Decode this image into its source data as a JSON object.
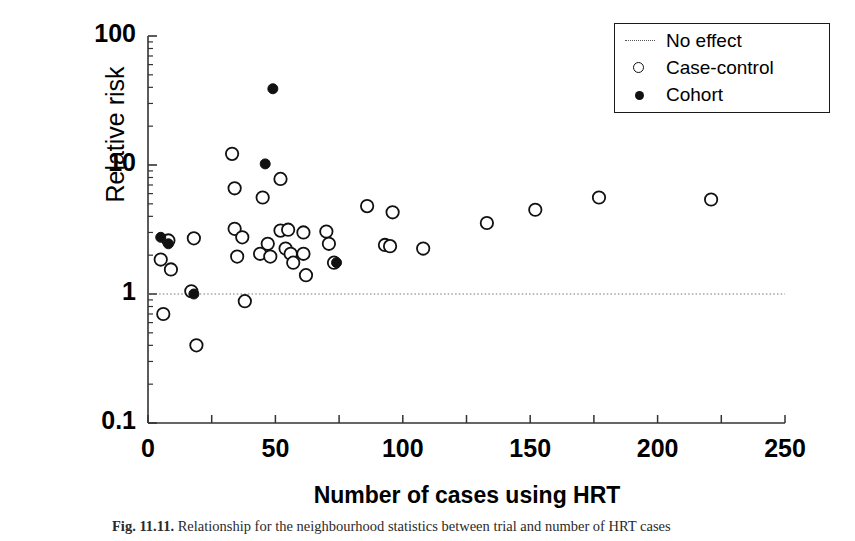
{
  "chart_data": {
    "type": "scatter",
    "title": "",
    "xlabel": "Number of cases using HRT",
    "ylabel": "Relative risk",
    "xlim": [
      0,
      250
    ],
    "ylim": [
      0.1,
      100
    ],
    "yscale": "log",
    "xscale": "linear",
    "grid": false,
    "xticks": [
      0,
      25,
      50,
      75,
      100,
      125,
      150,
      175,
      200,
      225,
      250
    ],
    "xtick_labels": [
      "0",
      "",
      "50",
      "",
      "100",
      "",
      "150",
      "",
      "200",
      "",
      "250"
    ],
    "yticks": [
      0.1,
      1,
      10,
      100
    ],
    "ytick_labels": [
      "0.1",
      "1",
      "10",
      "100"
    ],
    "legend_position": "top-right",
    "annotations": [
      {
        "name": "no-effect-line",
        "type": "hline",
        "y": 1.0,
        "style": "dotted",
        "label": "No effect"
      }
    ],
    "series": [
      {
        "name": "No effect",
        "marker": "dotted-line",
        "color": "#555555",
        "points": []
      },
      {
        "name": "Case-control",
        "marker": "open-circle",
        "color": "#111111",
        "points": [
          [
            5,
            1.85
          ],
          [
            6,
            0.7
          ],
          [
            8,
            2.6
          ],
          [
            9,
            1.55
          ],
          [
            17,
            1.05
          ],
          [
            18,
            2.7
          ],
          [
            19,
            0.4
          ],
          [
            33,
            12.2
          ],
          [
            34,
            6.6
          ],
          [
            34,
            3.2
          ],
          [
            35,
            1.95
          ],
          [
            37,
            2.75
          ],
          [
            38,
            0.88
          ],
          [
            44,
            2.05
          ],
          [
            45,
            5.6
          ],
          [
            47,
            2.45
          ],
          [
            48,
            1.95
          ],
          [
            52,
            7.8
          ],
          [
            52,
            3.1
          ],
          [
            54,
            2.25
          ],
          [
            55,
            3.15
          ],
          [
            56,
            2.05
          ],
          [
            57,
            1.75
          ],
          [
            61,
            3.0
          ],
          [
            61,
            2.05
          ],
          [
            62,
            1.4
          ],
          [
            70,
            3.05
          ],
          [
            71,
            2.45
          ],
          [
            73,
            1.75
          ],
          [
            86,
            4.8
          ],
          [
            93,
            2.4
          ],
          [
            95,
            2.35
          ],
          [
            96,
            4.3
          ],
          [
            108,
            2.25
          ],
          [
            133,
            3.55
          ],
          [
            152,
            4.5
          ],
          [
            177,
            5.6
          ],
          [
            221,
            5.4
          ]
        ]
      },
      {
        "name": "Cohort",
        "marker": "filled-circle",
        "color": "#111111",
        "points": [
          [
            5,
            2.75
          ],
          [
            8,
            2.45
          ],
          [
            18,
            1.0
          ],
          [
            46,
            10.2
          ],
          [
            49,
            39.0
          ],
          [
            74,
            1.75
          ]
        ]
      }
    ]
  },
  "axes": {
    "ylabel": "Relative risk",
    "xlabel": "Number of cases using HRT"
  },
  "legend": {
    "items": [
      {
        "label": "No effect",
        "key": "dotted-line-key"
      },
      {
        "label": "Case-control",
        "key": "open-circle-key"
      },
      {
        "label": "Cohort",
        "key": "filled-circle-key"
      }
    ]
  },
  "caption": {
    "figure_label": "Fig. 11.11.",
    "text": "Relationship for the neighbourhood statistics between trial and number of HRT cases"
  }
}
